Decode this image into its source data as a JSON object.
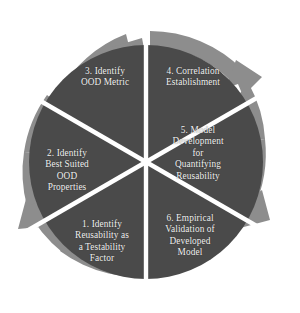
{
  "figure": {
    "type": "circular-process-diagram",
    "sector_count": 6,
    "background_color": "#ffffff",
    "disk_color": "#4a4a4a",
    "ring_color": "#8d8d8d",
    "divider_color": "#ffffff",
    "text_color": "#f2f2f2",
    "flow_direction": "clockwise"
  },
  "sectors": [
    {
      "index": "1",
      "label": "1. Identify\nReusability as\na Testability\nFactor",
      "name": "sector-1-identify-reusability"
    },
    {
      "index": "2",
      "label": "2. Identify\nBest Suited\nOOD\nProperties",
      "name": "sector-2-identify-best-suited-ood-properties"
    },
    {
      "index": "3",
      "label": "3. Identify\nOOD Metric",
      "name": "sector-3-identify-ood-metric"
    },
    {
      "index": "4",
      "label": "4. Correlation\nEstablishment",
      "name": "sector-4-correlation-establishment"
    },
    {
      "index": "5",
      "label": "5. Model\nDevelopment\nfor\nQuantifying\nReusability",
      "name": "sector-5-model-development"
    },
    {
      "index": "6",
      "label": "6. Empirical\nValidation of\nDeveloped\nModel",
      "name": "sector-6-empirical-validation"
    }
  ],
  "arrows": [
    {
      "name": "arrow-head-top",
      "position": "12 o'clock"
    },
    {
      "name": "arrow-head-upper-right",
      "position": "2 o'clock"
    },
    {
      "name": "arrow-head-lower-right",
      "position": "4 o'clock"
    },
    {
      "name": "arrow-head-lower-left",
      "position": "8 o'clock"
    },
    {
      "name": "arrow-head-upper-left",
      "position": "10 o'clock"
    }
  ]
}
